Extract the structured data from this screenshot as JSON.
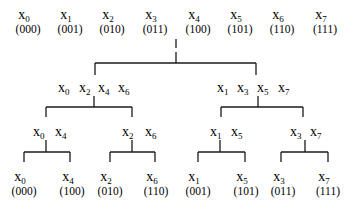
{
  "diagram": {
    "type": "recursive even-odd split tree (bit-reversal permutation)",
    "top_row": [
      {
        "name": "x",
        "sub": "0",
        "bin": "(000)"
      },
      {
        "name": "x",
        "sub": "1",
        "bin": "(001)"
      },
      {
        "name": "x",
        "sub": "2",
        "bin": "(010)"
      },
      {
        "name": "x",
        "sub": "3",
        "bin": "(011)"
      },
      {
        "name": "x",
        "sub": "4",
        "bin": "(100)"
      },
      {
        "name": "x",
        "sub": "5",
        "bin": "(101)"
      },
      {
        "name": "x",
        "sub": "6",
        "bin": "(110)"
      },
      {
        "name": "x",
        "sub": "7",
        "bin": "(111)"
      }
    ],
    "level2": [
      {
        "items": [
          {
            "name": "x",
            "sub": "0"
          },
          {
            "name": "x",
            "sub": "2"
          },
          {
            "name": "x",
            "sub": "4"
          },
          {
            "name": "x",
            "sub": "6"
          }
        ]
      },
      {
        "items": [
          {
            "name": "x",
            "sub": "1"
          },
          {
            "name": "x",
            "sub": "3"
          },
          {
            "name": "x",
            "sub": "5"
          },
          {
            "name": "x",
            "sub": "7"
          }
        ]
      }
    ],
    "level3": [
      {
        "items": [
          {
            "name": "x",
            "sub": "0"
          },
          {
            "name": "x",
            "sub": "4"
          }
        ]
      },
      {
        "items": [
          {
            "name": "x",
            "sub": "2"
          },
          {
            "name": "x",
            "sub": "6"
          }
        ]
      },
      {
        "items": [
          {
            "name": "x",
            "sub": "1"
          },
          {
            "name": "x",
            "sub": "5"
          }
        ]
      },
      {
        "items": [
          {
            "name": "x",
            "sub": "3"
          },
          {
            "name": "x",
            "sub": "7"
          }
        ]
      }
    ],
    "bottom_row": [
      {
        "name": "x",
        "sub": "0",
        "bin": "(000)"
      },
      {
        "name": "x",
        "sub": "4",
        "bin": "(100)"
      },
      {
        "name": "x",
        "sub": "2",
        "bin": "(010)"
      },
      {
        "name": "x",
        "sub": "6",
        "bin": "(110)"
      },
      {
        "name": "x",
        "sub": "1",
        "bin": "(001)"
      },
      {
        "name": "x",
        "sub": "5",
        "bin": "(101)"
      },
      {
        "name": "x",
        "sub": "3",
        "bin": "(011)"
      },
      {
        "name": "x",
        "sub": "7",
        "bin": "(111)"
      }
    ]
  }
}
